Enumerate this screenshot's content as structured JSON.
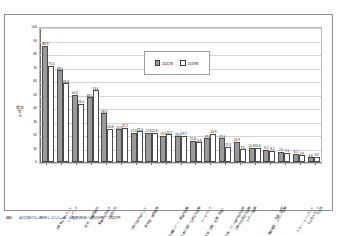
{
  "figure": {
    "caption_number": "図6",
    "caption_text": "訪日旅行に期待したいこと（複数回答）2019年・2022年"
  },
  "legend": {
    "position": "inside-top-center",
    "items": [
      {
        "label": "2022年",
        "style": "filled",
        "color": "#9a9a9a"
      },
      {
        "label": "2019年",
        "style": "open",
        "color": "#ffffff"
      }
    ]
  },
  "colors": {
    "series_2022": "#9a9a9a",
    "series_2019": "#ffffff",
    "bar_outline": "#4a4a4a",
    "grid": "#d3d3d3",
    "axis": "#6e6e6e",
    "frame": "#8e8e8e"
  },
  "chart_data": {
    "type": "bar",
    "title": "",
    "xlabel": "",
    "ylabel": "選択率",
    "yunit": "%",
    "ylim": [
      0,
      100
    ],
    "yticks": [
      0,
      10,
      20,
      30,
      40,
      50,
      60,
      70,
      80,
      90,
      100
    ],
    "grid": true,
    "legend_position": "inside-top-center",
    "categories": [
      "日本食を食べること",
      "ショッピング",
      "自然・景勝地観光",
      "繁華街の街歩き",
      "温泉入浴",
      "日本の酒を飲むこと",
      "美術館・博物館等",
      "自然体験ツアー・農漁村体験",
      "日本の歴史・伝統文化体験",
      "四季の体感（花見・紅葉・雪等）",
      "テーマパーク",
      "映画・アニメ縁の地を訪問",
      "日本の日常生活体験",
      "スポーツ観戦",
      "舞台鑑賞・スポーツ体験",
      "治療・健診",
      "スキー・スノーボード",
      "その他スポーツ",
      "その他"
    ],
    "series": [
      {
        "name": "2022年",
        "values": [
          86.9,
          68.5,
          50.3,
          48.2,
          36.3,
          24.3,
          21.6,
          21.6,
          19.6,
          19.3,
          15.8,
          17.8,
          17.6,
          14.9,
          10.8,
          9.2,
          7.5,
          6.1,
          3.6
        ]
      },
      {
        "name": "2019年",
        "values": [
          71.6,
          58.8,
          43.4,
          53.6,
          24.8,
          25.7,
          23.0,
          21.8,
          20.7,
          19.7,
          14.8,
          20.9,
          11.3,
          9.5,
          10.6,
          8.2,
          7.1,
          4.9,
          3.9
        ]
      }
    ]
  }
}
